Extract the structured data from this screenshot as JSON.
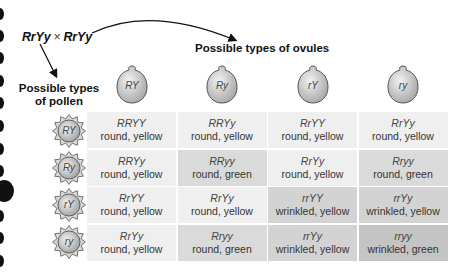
{
  "cross": {
    "parent1": "RrYy",
    "operator": "×",
    "parent2": "RrYy"
  },
  "ovules_title": "Possible types of ovules",
  "pollen_title_line1": "Possible types",
  "pollen_title_line2": "of pollen",
  "ovules": [
    "RY",
    "Ry",
    "rY",
    "ry"
  ],
  "pollen": [
    "RY",
    "Ry",
    "rY",
    "ry"
  ],
  "grid": [
    [
      {
        "genotype": "RRYY",
        "phenotype": "round, yellow",
        "shade": 0
      },
      {
        "genotype": "RRYy",
        "phenotype": "round, yellow",
        "shade": 0
      },
      {
        "genotype": "RrYY",
        "phenotype": "round, yellow",
        "shade": 0
      },
      {
        "genotype": "RrYy",
        "phenotype": "round, yellow",
        "shade": 0
      }
    ],
    [
      {
        "genotype": "RRYy",
        "phenotype": "round, yellow",
        "shade": 0
      },
      {
        "genotype": "RRyy",
        "phenotype": "round, green",
        "shade": 1
      },
      {
        "genotype": "RrYy",
        "phenotype": "round, yellow",
        "shade": 0
      },
      {
        "genotype": "Rryy",
        "phenotype": "round, green",
        "shade": 1
      }
    ],
    [
      {
        "genotype": "RrYY",
        "phenotype": "round, yellow",
        "shade": 0
      },
      {
        "genotype": "RrYy",
        "phenotype": "round, yellow",
        "shade": 0
      },
      {
        "genotype": "rrYY",
        "phenotype": "wrinkled, yellow",
        "shade": 2
      },
      {
        "genotype": "rrYy",
        "phenotype": "wrinkled, yellow",
        "shade": 2
      }
    ],
    [
      {
        "genotype": "RrYy",
        "phenotype": "round, yellow",
        "shade": 0
      },
      {
        "genotype": "Rryy",
        "phenotype": "round, green",
        "shade": 1
      },
      {
        "genotype": "rrYy",
        "phenotype": "wrinkled, yellow",
        "shade": 2
      },
      {
        "genotype": "rryy",
        "phenotype": "wrinkled, green",
        "shade": 3
      }
    ]
  ]
}
